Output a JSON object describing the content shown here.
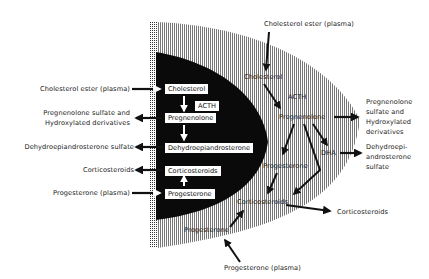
{
  "diagram": {
    "colors": {
      "ink": "#111111",
      "background": "#ffffff",
      "hatch": "#555555"
    },
    "left_external": {
      "cholesterol_ester": "Cholesterol ester (plasma)",
      "preg_sulfate_line1": "Pregnenolone sulfate and",
      "preg_sulfate_line2": "Hydroxylated derivatives",
      "dhea_sulfate": "Dehydroepiandrosterone sulfate",
      "corticosteroids": "Corticosteroids",
      "progesterone_plasma": "Progesterone (plasma)"
    },
    "inner_boxes": {
      "cholesterol": "Cholesterol",
      "acth": "ACTH",
      "pregnenolone": "Pregnenolone",
      "dhea": "Dehydroepiandrosterone",
      "corticosteroids": "Corticosteroids",
      "progesterone": "Progesterone"
    },
    "outer_zone": {
      "cholesterol_ester": "Cholesterol ester (plasma)",
      "cholesterol": "Cholesterol",
      "acth": "ACTH",
      "pregnenolone": "Pregnenolone",
      "dha": "DHA",
      "progesterone_upper": "Progesterone",
      "corticosteroids": "Corticosteroids",
      "progesterone_lower": "Progesterone",
      "progesterone_plasma": "Progesterone (plasma)"
    },
    "right_external": {
      "preg_line1": "Pregnenolone",
      "preg_line2": "sulfate and",
      "preg_line3": "Hydroxylated",
      "preg_line4": "derivatives",
      "dhea_line1": "Dehydroepi-",
      "dhea_line2": "androsterone",
      "dhea_line3": "sulfate",
      "corticosteroids": "Corticosteroids"
    }
  }
}
